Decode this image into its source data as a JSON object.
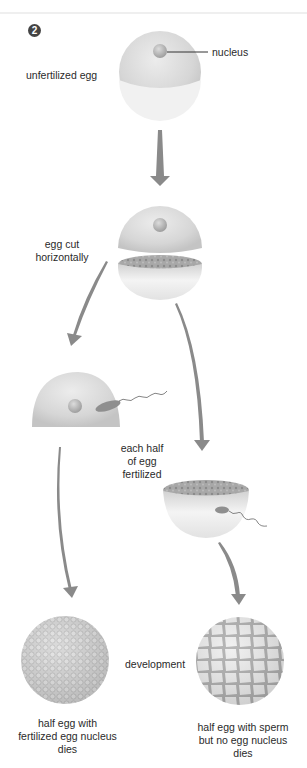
{
  "figure": {
    "step_number": "2",
    "labels": {
      "nucleus": "nucleus",
      "unfertilized_egg": "unfertilized egg",
      "egg_cut_line1": "egg cut",
      "egg_cut_line2": "horizontally",
      "each_half_line1": "each half",
      "each_half_line2": "of egg",
      "each_half_line3": "fertilized",
      "development": "development",
      "left_result_line1": "half egg with",
      "left_result_line2": "fertilized egg nucleus",
      "left_result_line3": "dies",
      "right_result_line1": "half egg with sperm",
      "right_result_line2": "but no egg nucleus",
      "right_result_line3": "dies"
    },
    "colors": {
      "egg_fill": "#d9d9d9",
      "egg_light": "#f0f0f0",
      "nucleus": "#b5b5b5",
      "arrow": "#8a8a8a",
      "cut_surface": "#9a9a9a"
    }
  }
}
